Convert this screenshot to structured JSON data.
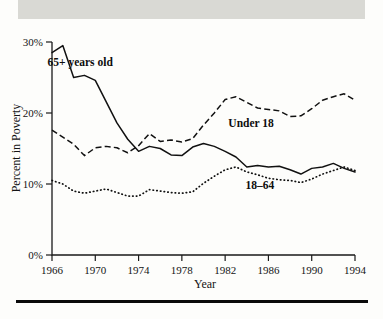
{
  "figure": {
    "header_band_text": "",
    "background_color": "#fdfdfb",
    "band_color": "#d9d9d4",
    "rule_color": "#0a0a0a"
  },
  "chart_data": {
    "type": "line",
    "title": "",
    "xlabel": "Year",
    "ylabel": "Percent in Poverty",
    "xlim": [
      1966,
      1994
    ],
    "ylim": [
      0,
      30
    ],
    "grid": false,
    "legend_position": "inline-annotations",
    "xtick_labels": [
      "1966",
      "1970",
      "1974",
      "1978",
      "1982",
      "1986",
      "1990",
      "1994"
    ],
    "xticks": [
      1966,
      1970,
      1974,
      1978,
      1982,
      1986,
      1990,
      1994
    ],
    "ytick_labels": [
      "0%",
      "10%",
      "20%",
      "30%"
    ],
    "yticks": [
      0,
      10,
      20,
      30
    ],
    "x": [
      1966,
      1967,
      1968,
      1969,
      1970,
      1971,
      1972,
      1973,
      1974,
      1975,
      1976,
      1977,
      1978,
      1979,
      1980,
      1981,
      1982,
      1983,
      1984,
      1985,
      1986,
      1987,
      1988,
      1989,
      1990,
      1991,
      1992,
      1993,
      1994
    ],
    "series": [
      {
        "name": "65+ years old",
        "style": "solid",
        "label_x": 1968.6,
        "label_y": 26.6,
        "values": [
          28.5,
          29.5,
          25.0,
          25.3,
          24.6,
          21.6,
          18.6,
          16.3,
          14.6,
          15.3,
          15.0,
          14.1,
          14.0,
          15.2,
          15.7,
          15.3,
          14.6,
          13.8,
          12.4,
          12.6,
          12.4,
          12.5,
          12.0,
          11.4,
          12.2,
          12.4,
          12.9,
          12.2,
          11.7
        ]
      },
      {
        "name": "Under 18",
        "style": "dashed",
        "label_x": 1984.4,
        "label_y": 18.0,
        "values": [
          17.6,
          16.6,
          15.6,
          14.0,
          15.1,
          15.3,
          15.1,
          14.4,
          15.4,
          17.1,
          16.0,
          16.2,
          15.9,
          16.4,
          18.3,
          20.0,
          21.9,
          22.3,
          21.5,
          20.7,
          20.5,
          20.3,
          19.5,
          19.6,
          20.6,
          21.8,
          22.3,
          22.7,
          21.8
        ]
      },
      {
        "name": "18–64",
        "style": "dotted",
        "label_x": 1985.2,
        "label_y": 9.3,
        "values": [
          10.5,
          10.0,
          9.0,
          8.7,
          9.0,
          9.3,
          8.8,
          8.3,
          8.3,
          9.2,
          9.0,
          8.8,
          8.7,
          8.9,
          10.1,
          11.1,
          12.0,
          12.4,
          11.7,
          11.3,
          10.8,
          10.6,
          10.5,
          10.2,
          10.7,
          11.4,
          11.9,
          12.4,
          11.9
        ]
      }
    ]
  }
}
